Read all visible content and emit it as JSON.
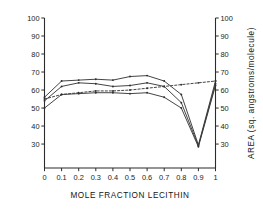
{
  "chart_data": {
    "type": "line",
    "title": "",
    "xlabel": "MOLE FRACTION LECITHIN",
    "ylabel": "",
    "ylabel_right": "AREA (sq. angstroms/molecule)",
    "xlim": [
      0,
      1
    ],
    "ylim": [
      16.7,
      100
    ],
    "grid": false,
    "legend": "none",
    "x": [
      0,
      0.1,
      0.2,
      0.3,
      0.4,
      0.5,
      0.6,
      0.7,
      0.8,
      0.9,
      1
    ],
    "xticks": [
      "0",
      "0.1",
      "0.2",
      "0.3",
      "0.4",
      "0.5",
      "0.6",
      "0.7",
      "0.8",
      "0.9",
      "1"
    ],
    "yticks_left": [
      "30",
      "40",
      "50",
      "60",
      "70",
      "80",
      "90",
      "100"
    ],
    "yticks_right": [
      "30",
      "40",
      "50",
      "60",
      "70",
      "80",
      "90",
      "100"
    ],
    "ytick_values": [
      30,
      40,
      50,
      60,
      70,
      80,
      90,
      100
    ],
    "series": [
      {
        "name": "upper-curve",
        "style": "solid",
        "values": [
          56,
          65,
          65.5,
          66,
          65.5,
          67.5,
          68,
          65,
          57.5,
          29.5,
          65
        ]
      },
      {
        "name": "middle-curve",
        "style": "solid",
        "values": [
          54,
          62,
          64,
          63.5,
          62,
          62.5,
          64,
          62,
          53,
          29,
          63.5
        ]
      },
      {
        "name": "lower-curve",
        "style": "solid",
        "values": [
          50,
          57.5,
          58,
          58.5,
          58.5,
          58,
          58.5,
          56,
          50,
          28.5,
          62.5
        ]
      },
      {
        "name": "dashed-curve",
        "style": "dashed",
        "values": [
          55,
          57.5,
          58.5,
          59.5,
          59.5,
          60,
          61,
          62,
          63,
          64,
          65
        ]
      }
    ]
  }
}
